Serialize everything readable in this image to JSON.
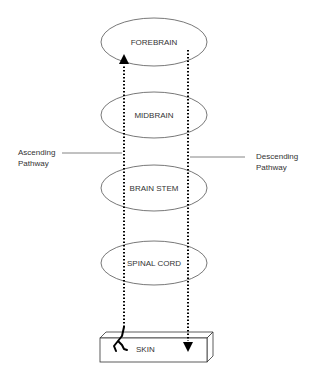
{
  "diagram": {
    "type": "flow",
    "nodes": [
      {
        "id": "forebrain",
        "label": "FOREBRAIN"
      },
      {
        "id": "midbrain",
        "label": "MIDBRAIN"
      },
      {
        "id": "brainstem",
        "label": "BRAIN STEM"
      },
      {
        "id": "spinalcord",
        "label": "SPINAL CORD"
      },
      {
        "id": "skin",
        "label": "SKIN"
      }
    ],
    "pathways": [
      {
        "id": "ascending",
        "label_line1": "Ascending",
        "label_line2": "Pathway",
        "from": "skin",
        "to": "forebrain"
      },
      {
        "id": "descending",
        "label_line1": "Descending",
        "label_line2": "Pathway",
        "from": "forebrain",
        "to": "skin"
      }
    ]
  }
}
